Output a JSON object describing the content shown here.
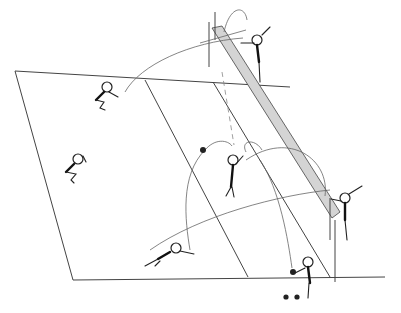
{
  "diagram": {
    "type": "volleyball-court-play-diagram",
    "colors": {
      "ink": "#222222",
      "net_fill": "#cfcfcf",
      "background": "#ffffff"
    },
    "court": {
      "outline": [
        [
          15,
          71
        ],
        [
          290,
          87
        ],
        [
          385,
          277
        ],
        [
          73,
          277
        ]
      ],
      "attack_line": [
        [
          145,
          80
        ],
        [
          248,
          277
        ]
      ],
      "net": {
        "from": [
          212,
          22
        ],
        "to": [
          335,
          232
        ],
        "shaded": true
      }
    },
    "players": [
      {
        "id": "blocker-top",
        "x": 255,
        "y": 42,
        "pose": "jumping"
      },
      {
        "id": "back-left-crouch",
        "x": 106,
        "y": 88,
        "pose": "crouching"
      },
      {
        "id": "left-crouch",
        "x": 76,
        "y": 160,
        "pose": "crouching"
      },
      {
        "id": "setter-middle",
        "x": 233,
        "y": 162,
        "pose": "standing"
      },
      {
        "id": "blocker-right",
        "x": 346,
        "y": 198,
        "pose": "jumping"
      },
      {
        "id": "diving-defender",
        "x": 176,
        "y": 247,
        "pose": "diving"
      },
      {
        "id": "server-bottom",
        "x": 307,
        "y": 262,
        "pose": "serving"
      }
    ],
    "balls": [
      {
        "x": 204,
        "y": 150
      },
      {
        "x": 293,
        "y": 272
      }
    ],
    "markers": [
      {
        "x": 285,
        "y": 297
      },
      {
        "x": 297,
        "y": 297
      }
    ]
  }
}
